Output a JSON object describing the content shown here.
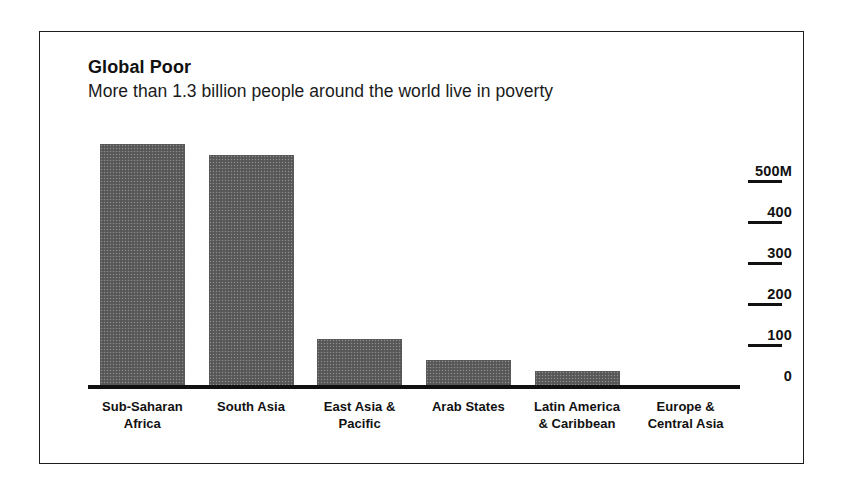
{
  "chart_data": {
    "type": "bar",
    "title": "Global Poor",
    "subtitle": "More than 1.3 billion people around the world live in poverty",
    "xlabel": "",
    "ylabel": "",
    "unit": "millions of people",
    "grid": false,
    "legend": false,
    "ylim": [
      0,
      500
    ],
    "yticks": [
      0,
      100,
      200,
      300,
      400,
      500
    ],
    "ytick_labels": [
      "0",
      "100",
      "200",
      "300",
      "400",
      "500M"
    ],
    "categories": [
      "Sub-Saharan Africa",
      "South Asia",
      "East Asia & Pacific",
      "Arab States",
      "Latin America & Caribbean",
      "Europe & Central Asia"
    ],
    "values": [
      595,
      568,
      120,
      68,
      42,
      4
    ],
    "bar_color": "#5e5e5e",
    "axis_color": "#111111",
    "frame_color": "#1c1c1c",
    "background": "#ffffff"
  },
  "axis": {
    "ticks": [
      {
        "label": "500M",
        "value": 500
      },
      {
        "label": "400",
        "value": 400
      },
      {
        "label": "300",
        "value": 300
      },
      {
        "label": "200",
        "value": 200
      },
      {
        "label": "100",
        "value": 100
      },
      {
        "label": "0",
        "value": 0
      }
    ]
  },
  "bars": [
    {
      "label_line1": "Sub-Saharan",
      "label_line2": "Africa",
      "value": 595
    },
    {
      "label_line1": "South Asia",
      "label_line2": "",
      "value": 568
    },
    {
      "label_line1": "East Asia &",
      "label_line2": "Pacific",
      "value": 120
    },
    {
      "label_line1": "Arab States",
      "label_line2": "",
      "value": 68
    },
    {
      "label_line1": "Latin America",
      "label_line2": "& Caribbean",
      "value": 42
    },
    {
      "label_line1": "Europe &",
      "label_line2": "Central Asia",
      "value": 4
    }
  ]
}
